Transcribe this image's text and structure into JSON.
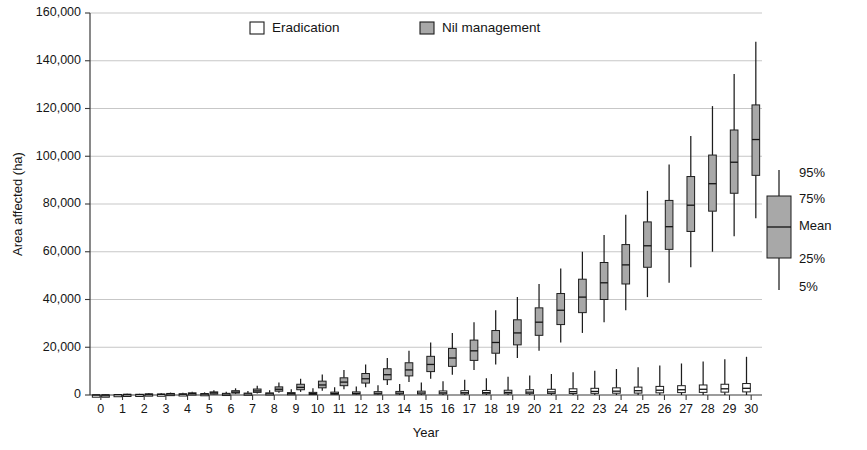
{
  "chart_data": {
    "type": "box",
    "title": "",
    "xlabel": "Year",
    "ylabel": "Area affected (ha)",
    "ylim": [
      0,
      160000
    ],
    "ytick_labels": [
      "0",
      "20,000",
      "40,000",
      "60,000",
      "80,000",
      "100,000",
      "120,000",
      "140,000",
      "160,000"
    ],
    "ytick_values": [
      0,
      20000,
      40000,
      60000,
      80000,
      100000,
      120000,
      140000,
      160000
    ],
    "xtick_labels": [
      "0",
      "1",
      "2",
      "3",
      "4",
      "5",
      "6",
      "7",
      "8",
      "9",
      "10",
      "11",
      "12",
      "13",
      "14",
      "15",
      "16",
      "17",
      "18",
      "19",
      "20",
      "21",
      "22",
      "23",
      "24",
      "25",
      "26",
      "27",
      "28",
      "29",
      "30"
    ],
    "x": [
      0,
      1,
      2,
      3,
      4,
      5,
      6,
      7,
      8,
      9,
      10,
      11,
      12,
      13,
      14,
      15,
      16,
      17,
      18,
      19,
      20,
      21,
      22,
      23,
      24,
      25,
      26,
      27,
      28,
      29,
      30
    ],
    "grid": "horizontal",
    "legend_position": "top-center",
    "box_stats_order": [
      "p5",
      "p25",
      "mean",
      "p75",
      "p95"
    ],
    "series": [
      {
        "name": "Eradication",
        "fill": "#ffffff",
        "boxes": [
          {
            "year": 0,
            "p5": 0,
            "p25": 0,
            "mean": 0,
            "p75": 0,
            "p95": 0
          },
          {
            "year": 1,
            "p5": 0,
            "p25": 0,
            "mean": 100,
            "p75": 200,
            "p95": 300
          },
          {
            "year": 2,
            "p5": 0,
            "p25": 0,
            "mean": 150,
            "p75": 300,
            "p95": 500
          },
          {
            "year": 3,
            "p5": 0,
            "p25": 100,
            "mean": 250,
            "p75": 400,
            "p95": 700
          },
          {
            "year": 4,
            "p5": 0,
            "p25": 100,
            "mean": 300,
            "p75": 500,
            "p95": 900
          },
          {
            "year": 5,
            "p5": 0,
            "p25": 150,
            "mean": 350,
            "p75": 600,
            "p95": 1100
          },
          {
            "year": 6,
            "p5": 0,
            "p25": 200,
            "mean": 400,
            "p75": 700,
            "p95": 1400
          },
          {
            "year": 7,
            "p5": 0,
            "p25": 200,
            "mean": 450,
            "p75": 800,
            "p95": 1700
          },
          {
            "year": 8,
            "p5": 0,
            "p25": 250,
            "mean": 500,
            "p75": 900,
            "p95": 2000
          },
          {
            "year": 9,
            "p5": 0,
            "p25": 250,
            "mean": 550,
            "p75": 1000,
            "p95": 2400
          },
          {
            "year": 10,
            "p5": 0,
            "p25": 300,
            "mean": 600,
            "p75": 1100,
            "p95": 2800
          },
          {
            "year": 11,
            "p5": 0,
            "p25": 300,
            "mean": 650,
            "p75": 1200,
            "p95": 3200
          },
          {
            "year": 12,
            "p5": 0,
            "p25": 350,
            "mean": 700,
            "p75": 1300,
            "p95": 3600
          },
          {
            "year": 13,
            "p5": 0,
            "p25": 350,
            "mean": 750,
            "p75": 1400,
            "p95": 4100
          },
          {
            "year": 14,
            "p5": 0,
            "p25": 400,
            "mean": 800,
            "p75": 1500,
            "p95": 4600
          },
          {
            "year": 15,
            "p5": 0,
            "p25": 400,
            "mean": 850,
            "p75": 1600,
            "p95": 5200
          },
          {
            "year": 16,
            "p5": 0,
            "p25": 450,
            "mean": 900,
            "p75": 1700,
            "p95": 5800
          },
          {
            "year": 17,
            "p5": 0,
            "p25": 450,
            "mean": 950,
            "p75": 1800,
            "p95": 6400
          },
          {
            "year": 18,
            "p5": 0,
            "p25": 500,
            "mean": 1000,
            "p75": 1900,
            "p95": 7000
          },
          {
            "year": 19,
            "p5": 0,
            "p25": 500,
            "mean": 1100,
            "p75": 2000,
            "p95": 7600
          },
          {
            "year": 20,
            "p5": 0,
            "p25": 550,
            "mean": 1200,
            "p75": 2200,
            "p95": 8200
          },
          {
            "year": 21,
            "p5": 0,
            "p25": 600,
            "mean": 1300,
            "p75": 2400,
            "p95": 8800
          },
          {
            "year": 22,
            "p5": 0,
            "p25": 650,
            "mean": 1400,
            "p75": 2600,
            "p95": 9500
          },
          {
            "year": 23,
            "p5": 0,
            "p25": 700,
            "mean": 1500,
            "p75": 2800,
            "p95": 10200
          },
          {
            "year": 24,
            "p5": 0,
            "p25": 750,
            "mean": 1600,
            "p75": 3000,
            "p95": 10900
          },
          {
            "year": 25,
            "p5": 0,
            "p25": 800,
            "mean": 1800,
            "p75": 3300,
            "p95": 11600
          },
          {
            "year": 26,
            "p5": 0,
            "p25": 900,
            "mean": 2000,
            "p75": 3600,
            "p95": 12400
          },
          {
            "year": 27,
            "p5": 0,
            "p25": 1000,
            "mean": 2200,
            "p75": 3900,
            "p95": 13200
          },
          {
            "year": 28,
            "p5": 0,
            "p25": 1100,
            "mean": 2400,
            "p75": 4200,
            "p95": 14000
          },
          {
            "year": 29,
            "p5": 0,
            "p25": 1200,
            "mean": 2600,
            "p75": 4500,
            "p95": 15000
          },
          {
            "year": 30,
            "p5": 0,
            "p25": 1300,
            "mean": 2800,
            "p75": 4800,
            "p95": 16000
          }
        ]
      },
      {
        "name": "Nil management",
        "fill": "#a8a8a8",
        "boxes": [
          {
            "year": 0,
            "p5": 0,
            "p25": 0,
            "mean": 0,
            "p75": 0,
            "p95": 100
          },
          {
            "year": 1,
            "p5": 0,
            "p25": 100,
            "mean": 200,
            "p75": 300,
            "p95": 500
          },
          {
            "year": 2,
            "p5": 100,
            "p25": 200,
            "mean": 300,
            "p75": 450,
            "p95": 700
          },
          {
            "year": 3,
            "p5": 150,
            "p25": 300,
            "mean": 450,
            "p75": 650,
            "p95": 1000
          },
          {
            "year": 4,
            "p5": 200,
            "p25": 400,
            "mean": 600,
            "p75": 900,
            "p95": 1400
          },
          {
            "year": 5,
            "p5": 300,
            "p25": 600,
            "mean": 900,
            "p75": 1300,
            "p95": 2000
          },
          {
            "year": 6,
            "p5": 400,
            "p25": 800,
            "mean": 1200,
            "p75": 1800,
            "p95": 2800
          },
          {
            "year": 7,
            "p5": 600,
            "p25": 1100,
            "mean": 1700,
            "p75": 2500,
            "p95": 3900
          },
          {
            "year": 8,
            "p5": 900,
            "p25": 1600,
            "mean": 2400,
            "p75": 3400,
            "p95": 5200
          },
          {
            "year": 9,
            "p5": 1300,
            "p25": 2200,
            "mean": 3200,
            "p75": 4500,
            "p95": 6800
          },
          {
            "year": 10,
            "p5": 1800,
            "p25": 3000,
            "mean": 4200,
            "p75": 5800,
            "p95": 8600
          },
          {
            "year": 11,
            "p5": 2400,
            "p25": 3900,
            "mean": 5400,
            "p75": 7200,
            "p95": 10500
          },
          {
            "year": 12,
            "p5": 3200,
            "p25": 5000,
            "mean": 6800,
            "p75": 9000,
            "p95": 12800
          },
          {
            "year": 13,
            "p5": 4200,
            "p25": 6400,
            "mean": 8500,
            "p75": 11000,
            "p95": 15500
          },
          {
            "year": 14,
            "p5": 5400,
            "p25": 8000,
            "mean": 10500,
            "p75": 13500,
            "p95": 18500
          },
          {
            "year": 15,
            "p5": 6800,
            "p25": 9800,
            "mean": 12800,
            "p75": 16200,
            "p95": 22000
          },
          {
            "year": 16,
            "p5": 8500,
            "p25": 12000,
            "mean": 15500,
            "p75": 19500,
            "p95": 26000
          },
          {
            "year": 17,
            "p5": 10500,
            "p25": 14500,
            "mean": 18500,
            "p75": 23000,
            "p95": 30500
          },
          {
            "year": 18,
            "p5": 12800,
            "p25": 17500,
            "mean": 22000,
            "p75": 27000,
            "p95": 35500
          },
          {
            "year": 19,
            "p5": 15500,
            "p25": 21000,
            "mean": 26000,
            "p75": 31500,
            "p95": 41000
          },
          {
            "year": 20,
            "p5": 18500,
            "p25": 25000,
            "mean": 30500,
            "p75": 36500,
            "p95": 46500
          },
          {
            "year": 21,
            "p5": 22000,
            "p25": 29500,
            "mean": 35500,
            "p75": 42500,
            "p95": 53000
          },
          {
            "year": 22,
            "p5": 26000,
            "p25": 34500,
            "mean": 41000,
            "p75": 48500,
            "p95": 60000
          },
          {
            "year": 23,
            "p5": 30500,
            "p25": 40000,
            "mean": 47000,
            "p75": 55500,
            "p95": 67000
          },
          {
            "year": 24,
            "p5": 35500,
            "p25": 46500,
            "mean": 54500,
            "p75": 63000,
            "p95": 75500
          },
          {
            "year": 25,
            "p5": 41000,
            "p25": 53500,
            "mean": 62500,
            "p75": 72500,
            "p95": 85500
          },
          {
            "year": 26,
            "p5": 47000,
            "p25": 61000,
            "mean": 70500,
            "p75": 81500,
            "p95": 96500
          },
          {
            "year": 27,
            "p5": 53500,
            "p25": 68500,
            "mean": 79500,
            "p75": 91500,
            "p95": 108500
          },
          {
            "year": 28,
            "p5": 60000,
            "p25": 77000,
            "mean": 88500,
            "p75": 100500,
            "p95": 121000
          },
          {
            "year": 29,
            "p5": 66500,
            "p25": 84500,
            "mean": 97500,
            "p75": 111000,
            "p95": 134500
          },
          {
            "year": 30,
            "p5": 74000,
            "p25": 92000,
            "mean": 107000,
            "p75": 121500,
            "p95": 148000
          }
        ]
      }
    ]
  },
  "legend": {
    "items": [
      {
        "label": "Eradication",
        "swatch": "#ffffff"
      },
      {
        "label": "Nil management",
        "swatch": "#a8a8a8"
      }
    ]
  },
  "box_key": {
    "labels": [
      "95%",
      "75%",
      "Mean",
      "25%",
      "5%"
    ],
    "swatch": "#a8a8a8"
  }
}
